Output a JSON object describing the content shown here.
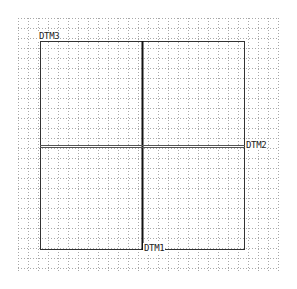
{
  "view": {
    "grid": {
      "x0": 18,
      "y0": 18,
      "x1": 278,
      "y1": 272,
      "spacing": 10,
      "color": "#9a9a9a"
    },
    "sketch_box": {
      "left": 40,
      "top": 41,
      "right": 245,
      "bottom": 250,
      "color": "#333333"
    },
    "datums": [
      {
        "name": "DTM3",
        "orientation": "vertical",
        "label": "DTM3"
      },
      {
        "name": "DTM2",
        "orientation": "horizontal",
        "label": "DTM2"
      },
      {
        "name": "DTM1",
        "orientation": "vertical",
        "label": "DTM1"
      }
    ],
    "colors": {
      "line": "#111111",
      "horizontal_line": "#555555"
    }
  }
}
